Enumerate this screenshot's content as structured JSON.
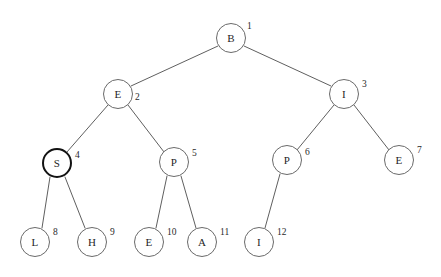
{
  "diagram": {
    "background_color": "#ffffff",
    "node_stroke_color": "#6a6a6a",
    "node_fill_color": "#ffffff",
    "highlight_stroke_color": "#121212",
    "edge_color": "#5f5f5f",
    "node_radius": 15,
    "nodes": [
      {
        "id": 1,
        "label": "B",
        "index": "1",
        "cx": 231,
        "cy": 38,
        "r": 15,
        "highlighted": false,
        "index_dx": 16,
        "index_dy": -16
      },
      {
        "id": 2,
        "label": "E",
        "index": "2",
        "cx": 118,
        "cy": 94,
        "r": 15,
        "highlighted": false,
        "index_dx": 17,
        "index_dy": -1
      },
      {
        "id": 3,
        "label": "I",
        "index": "3",
        "cx": 344,
        "cy": 94,
        "r": 15,
        "highlighted": false,
        "index_dx": 18,
        "index_dy": -14
      },
      {
        "id": 4,
        "label": "S",
        "index": "4",
        "cx": 57,
        "cy": 163,
        "r": 15,
        "highlighted": true,
        "index_dx": 18,
        "index_dy": -12
      },
      {
        "id": 5,
        "label": "P",
        "index": "5",
        "cx": 174,
        "cy": 162,
        "r": 15,
        "highlighted": false,
        "index_dx": 18,
        "index_dy": -13
      },
      {
        "id": 6,
        "label": "P",
        "index": "6",
        "cx": 287,
        "cy": 160,
        "r": 15,
        "highlighted": false,
        "index_dx": 18,
        "index_dy": -12
      },
      {
        "id": 7,
        "label": "E",
        "index": "7",
        "cx": 399,
        "cy": 160,
        "r": 15,
        "highlighted": false,
        "index_dx": 18,
        "index_dy": -14
      },
      {
        "id": 8,
        "label": "L",
        "index": "8",
        "cx": 35,
        "cy": 242,
        "r": 15,
        "highlighted": false,
        "index_dx": 18,
        "index_dy": -14
      },
      {
        "id": 9,
        "label": "H",
        "index": "9",
        "cx": 92,
        "cy": 242,
        "r": 15,
        "highlighted": false,
        "index_dx": 18,
        "index_dy": -14
      },
      {
        "id": 10,
        "label": "E",
        "index": "10",
        "cx": 149,
        "cy": 242,
        "r": 15,
        "highlighted": false,
        "index_dx": 18,
        "index_dy": -14
      },
      {
        "id": 11,
        "label": "A",
        "index": "11",
        "cx": 202,
        "cy": 242,
        "r": 15,
        "highlighted": false,
        "index_dx": 18,
        "index_dy": -14
      },
      {
        "id": 12,
        "label": "I",
        "index": "12",
        "cx": 259,
        "cy": 242,
        "r": 15,
        "highlighted": false,
        "index_dx": 18,
        "index_dy": -14
      }
    ],
    "edges": [
      {
        "from": 1,
        "to": 2,
        "x1": 218,
        "y1": 46,
        "x2": 131,
        "y2": 86
      },
      {
        "from": 1,
        "to": 3,
        "x1": 244,
        "y1": 46,
        "x2": 331,
        "y2": 86
      },
      {
        "from": 2,
        "to": 4,
        "x1": 108,
        "y1": 105,
        "x2": 67,
        "y2": 152
      },
      {
        "from": 2,
        "to": 5,
        "x1": 128,
        "y1": 105,
        "x2": 164,
        "y2": 152
      },
      {
        "from": 3,
        "to": 6,
        "x1": 334,
        "y1": 105,
        "x2": 297,
        "y2": 150
      },
      {
        "from": 3,
        "to": 7,
        "x1": 354,
        "y1": 105,
        "x2": 389,
        "y2": 150
      },
      {
        "from": 4,
        "to": 8,
        "x1": 50,
        "y1": 177,
        "x2": 42,
        "y2": 228
      },
      {
        "from": 4,
        "to": 9,
        "x1": 65,
        "y1": 177,
        "x2": 85,
        "y2": 228
      },
      {
        "from": 5,
        "to": 10,
        "x1": 167,
        "y1": 176,
        "x2": 156,
        "y2": 228
      },
      {
        "from": 5,
        "to": 11,
        "x1": 181,
        "y1": 176,
        "x2": 196,
        "y2": 228
      },
      {
        "from": 6,
        "to": 12,
        "x1": 280,
        "y1": 174,
        "x2": 265,
        "y2": 228
      }
    ]
  }
}
